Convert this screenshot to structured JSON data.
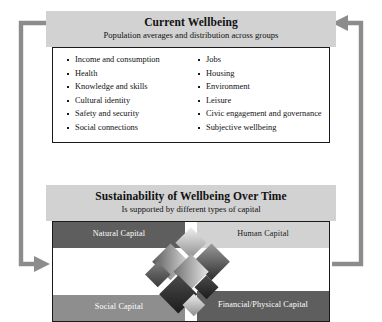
{
  "diagram": {
    "current_wellbeing": {
      "title": "Current Wellbeing",
      "subtitle": "Population averages and distribution across groups",
      "dimensions_left": [
        "Income and consumption",
        "Health",
        "Knowledge and skills",
        "Cultural identity",
        "Safety and security",
        "Social connections"
      ],
      "dimensions_right": [
        "Jobs",
        "Housing",
        "Environment",
        "Leisure",
        "Civic engagement and governance",
        "Subjective wellbeing"
      ]
    },
    "sustainability": {
      "title": "Sustainability of Wellbeing Over Time",
      "subtitle": "Is supported by different types of capital",
      "capitals": [
        {
          "label": "Natural Capital",
          "tone": "dark"
        },
        {
          "label": "Human Capital",
          "tone": "light"
        },
        {
          "label": "Social Capital",
          "tone": "mid"
        },
        {
          "label": "Financial/Physical Capital",
          "tone": "dark"
        }
      ]
    },
    "colors": {
      "header_band": "#d2d2d2",
      "capital_dark": "#5e5e5e",
      "capital_mid": "#8e8e8e",
      "capital_light": "#d2d2d2",
      "connector": "#8c8c8c",
      "border": "#1a1a1a"
    },
    "connectors": [
      {
        "name": "sustainability-to-wellbeing",
        "direction": "up-then-left",
        "side": "right"
      },
      {
        "name": "wellbeing-to-sustainability",
        "direction": "down-then-right",
        "side": "left"
      }
    ]
  }
}
